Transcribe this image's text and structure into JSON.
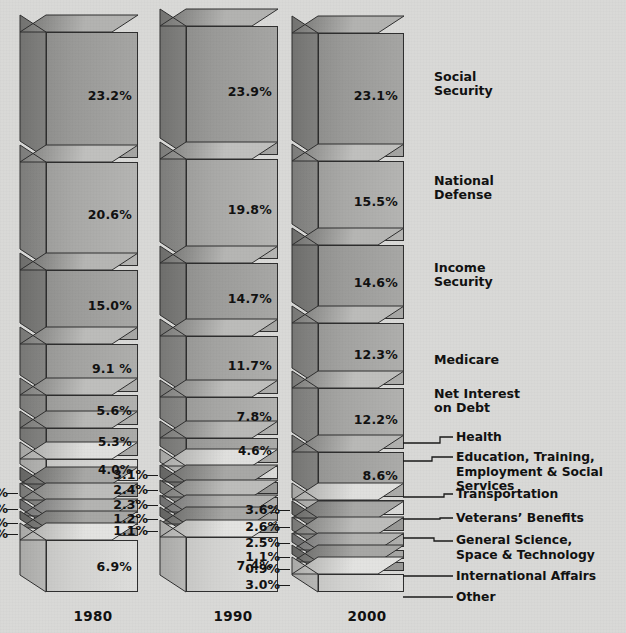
{
  "chart_data": {
    "type": "bar",
    "title": "Federal Budget Outlays by Category",
    "subtitle": "",
    "xlabel": "",
    "ylabel": "",
    "note": "Stacked 3-D block columns; each block is one budget category, labeled with its share of total outlays.",
    "categories": [
      "Social Security",
      "National Defense",
      "Income Security",
      "Medicare",
      "Net Interest on Debt",
      "Health",
      "Education, Training, Employment & Social Services",
      "Transportation",
      "Veterans' Benefits",
      "General Science, Space & Technology",
      "International Affairs",
      "Other"
    ],
    "x": [
      "1980",
      "1990",
      "2000"
    ],
    "series": [
      {
        "name": "1980",
        "values": [
          23.2,
          20.6,
          15.0,
          9.1,
          5.6,
          5.3,
          4.0,
          3.7,
          3.7,
          1.9,
          1.0,
          6.9
        ]
      },
      {
        "name": "1990",
        "values": [
          23.9,
          19.8,
          14.7,
          11.7,
          7.8,
          4.6,
          3.1,
          2.4,
          2.3,
          1.2,
          1.1,
          7.4
        ]
      },
      {
        "name": "2000",
        "values": [
          23.1,
          15.5,
          14.6,
          12.3,
          12.2,
          8.6,
          3.6,
          2.6,
          2.5,
          1.1,
          0.9,
          3.0
        ]
      }
    ],
    "legend_position": "right",
    "grid": false
  },
  "colors": {
    "background": "#d9d9d7",
    "text": "#111111",
    "outline": "#2f2f2f"
  },
  "columns": [
    {
      "year": "1980",
      "blocks": [
        {
          "value": "23.2%",
          "inside": true
        },
        {
          "value": "20.6%",
          "inside": true
        },
        {
          "value": "15.0%",
          "inside": true
        },
        {
          "value": "9.1 %",
          "inside": true
        },
        {
          "value": "5.6%",
          "inside": true
        },
        {
          "value": "5.3%",
          "inside": true
        },
        {
          "value": "4.0%",
          "inside": true
        },
        {
          "value": "3.7%",
          "inside": false
        },
        {
          "value": "3.7%",
          "inside": false
        },
        {
          "value": "1.9%",
          "inside": false
        },
        {
          "value": "1.0%",
          "inside": false
        },
        {
          "value": "6.9%",
          "inside": true
        }
      ]
    },
    {
      "year": "1990",
      "blocks": [
        {
          "value": "23.9%",
          "inside": true
        },
        {
          "value": "19.8%",
          "inside": true
        },
        {
          "value": "14.7%",
          "inside": true
        },
        {
          "value": "11.7%",
          "inside": true
        },
        {
          "value": "7.8%",
          "inside": true
        },
        {
          "value": "4.6%",
          "inside": true
        },
        {
          "value": "3.1%",
          "inside": false
        },
        {
          "value": "2.4%",
          "inside": false
        },
        {
          "value": "2.3%",
          "inside": false
        },
        {
          "value": "1.2%",
          "inside": false
        },
        {
          "value": "1.1%",
          "inside": false
        },
        {
          "value": "7.4%",
          "inside": true
        }
      ]
    },
    {
      "year": "2000",
      "blocks": [
        {
          "value": "23.1%",
          "inside": true
        },
        {
          "value": "15.5%",
          "inside": true
        },
        {
          "value": "14.6%",
          "inside": true
        },
        {
          "value": "12.3%",
          "inside": true
        },
        {
          "value": "12.2%",
          "inside": true
        },
        {
          "value": "8.6%",
          "inside": true
        },
        {
          "value": "3.6%",
          "inside": false
        },
        {
          "value": "2.6%",
          "inside": false
        },
        {
          "value": "2.5%",
          "inside": false
        },
        {
          "value": "1.1%",
          "inside": false
        },
        {
          "value": "0.9%",
          "inside": false
        },
        {
          "value": "3.0%",
          "inside": false
        }
      ]
    }
  ],
  "legend": {
    "direct": [
      {
        "label": "Social\nSecurity"
      },
      {
        "label": "National\nDefense"
      },
      {
        "label": "Income\nSecurity"
      },
      {
        "label": "Medicare"
      },
      {
        "label": "Net Interest\non Debt"
      }
    ],
    "leader": [
      {
        "label": "Health"
      },
      {
        "label": "Education, Training,\nEmployment & Social Services"
      },
      {
        "label": "Transportation"
      },
      {
        "label": "Veterans’ Benefits"
      },
      {
        "label": "General Science,\nSpace & Technology"
      },
      {
        "label": "International Affairs"
      },
      {
        "label": "Other"
      }
    ]
  }
}
